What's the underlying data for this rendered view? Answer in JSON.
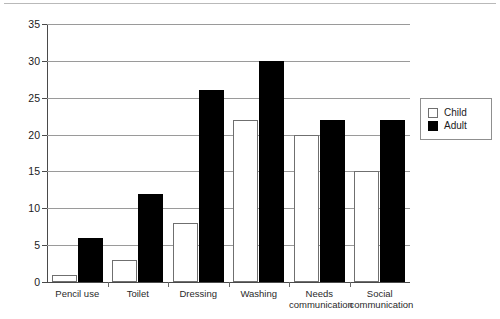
{
  "chart_data": {
    "type": "bar",
    "title": "",
    "subtitle": "",
    "xlabel": "",
    "ylabel": "",
    "ylim": [
      0,
      35
    ],
    "yticks": [
      0,
      5,
      10,
      15,
      20,
      25,
      30,
      35
    ],
    "ytick_labels": [
      "0",
      "5",
      "10",
      "15",
      "20",
      "25",
      "30",
      "35"
    ],
    "grid": true,
    "grid_axis": "y",
    "legend_position": "right",
    "categories": [
      "Pencil use",
      "Toilet",
      "Dressing",
      "Washing",
      "Needs communication",
      "Social communication"
    ],
    "category_lines": [
      [
        "Pencil use"
      ],
      [
        "Toilet"
      ],
      [
        "Dressing"
      ],
      [
        "Washing"
      ],
      [
        "Needs",
        "communication"
      ],
      [
        "Social",
        "communication"
      ]
    ],
    "series": [
      {
        "name": "Child",
        "color": "#ffffff",
        "edge_color": "#6f6f6f",
        "values": [
          1,
          3,
          8,
          22,
          20,
          15
        ]
      },
      {
        "name": "Adult",
        "color": "#000000",
        "edge_color": "#000000",
        "values": [
          6,
          12,
          26,
          30,
          22,
          22
        ]
      }
    ]
  },
  "legend": {
    "items": [
      {
        "label": "Child"
      },
      {
        "label": "Adult"
      }
    ]
  },
  "colors": {
    "child": "#ffffff",
    "adult": "#000000",
    "gridline": "#9a9a9a",
    "axis": "#4a4a4a",
    "text": "#1b1b1b"
  }
}
